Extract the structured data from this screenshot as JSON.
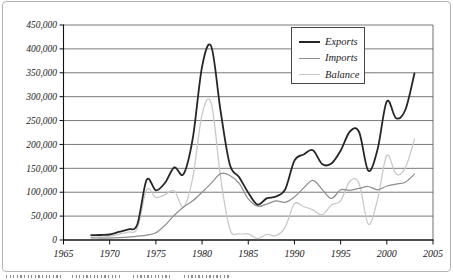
{
  "figure": {
    "background": "#ffffff",
    "frame_border_color": "#b4b4b4",
    "gridline_color": "#4d4d4d",
    "axis_color": "#111111",
    "tick_label_color": "#1a1a1a"
  },
  "chart_data": {
    "type": "line",
    "title": "",
    "xlabel": "",
    "ylabel": "",
    "grid": "horizontal",
    "legend_position": "top-right",
    "xlim": [
      1965,
      2005
    ],
    "ylim": [
      0,
      450000
    ],
    "x_ticks": [
      1965,
      1970,
      1975,
      1980,
      1985,
      1990,
      1995,
      2000,
      2005
    ],
    "x_tick_labels": [
      "1965",
      "1970",
      "1975",
      "1980",
      "1985",
      "1990",
      "1995",
      "2000",
      "2005"
    ],
    "y_ticks": [
      0,
      50000,
      100000,
      150000,
      200000,
      250000,
      300000,
      350000,
      400000,
      450000
    ],
    "y_tick_labels": [
      "0",
      "50,000",
      "100,000",
      "150,000",
      "200,000",
      "250,000",
      "300,000",
      "350,000",
      "400,000",
      "450,000"
    ],
    "x": [
      1968,
      1969,
      1970,
      1971,
      1972,
      1973,
      1974,
      1975,
      1976,
      1977,
      1978,
      1979,
      1980,
      1981,
      1982,
      1983,
      1984,
      1985,
      1986,
      1987,
      1988,
      1989,
      1990,
      1991,
      1992,
      1993,
      1994,
      1995,
      1996,
      1997,
      1998,
      1999,
      2000,
      2001,
      2002,
      2003
    ],
    "series": [
      {
        "name": "Exports",
        "color": "#262626",
        "width": 1.8,
        "values": [
          10000,
          10500,
          11500,
          17000,
          22500,
          33000,
          126000,
          104000,
          120000,
          152000,
          138000,
          213000,
          363000,
          405000,
          271000,
          158000,
          132000,
          99000,
          74000,
          87000,
          91000,
          106000,
          166000,
          179000,
          188000,
          159000,
          160000,
          187000,
          227000,
          226000,
          145000,
          190000,
          290000,
          255000,
          272000,
          349000
        ]
      },
      {
        "name": "Imports",
        "color": "#8e8e8e",
        "width": 1.25,
        "values": [
          4500,
          4000,
          4000,
          5000,
          6000,
          8000,
          10000,
          15000,
          31000,
          52000,
          69000,
          82000,
          100000,
          119000,
          139000,
          135000,
          119000,
          86000,
          71000,
          75000,
          82000,
          79000,
          90000,
          109000,
          125000,
          106000,
          87000,
          105000,
          104000,
          108000,
          112000,
          105000,
          113000,
          117000,
          121000,
          138000
        ]
      },
      {
        "name": "Balance",
        "color": "#c8c8c8",
        "width": 1.25,
        "values": [
          5500,
          6500,
          7500,
          12000,
          16500,
          25000,
          105000,
          89000,
          95000,
          103000,
          69000,
          131000,
          263000,
          286000,
          132000,
          23000,
          13000,
          13000,
          3000,
          12000,
          9000,
          27000,
          76000,
          70000,
          63000,
          53000,
          73000,
          82000,
          123000,
          118000,
          33000,
          85000,
          177000,
          138000,
          151000,
          211000
        ]
      }
    ]
  },
  "legend": {
    "items": [
      {
        "label": "Exports"
      },
      {
        "label": "Imports"
      },
      {
        "label": "Balance"
      }
    ]
  }
}
